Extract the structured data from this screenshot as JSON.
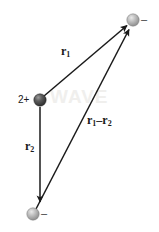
{
  "figure": {
    "background_color": "#ffffff",
    "watermark_text": "WAVE"
  },
  "charges": [
    {
      "id": "positive-charge",
      "label": "2+",
      "sign": "positive",
      "x": 40,
      "y": 100,
      "radius": 6,
      "color": "#4a4a4a"
    },
    {
      "id": "negative-charge-top",
      "label": "–",
      "sign": "negative",
      "x": 133,
      "y": 20,
      "radius": 6,
      "color": "#9a9a9a"
    },
    {
      "id": "negative-charge-bottom",
      "label": "–",
      "sign": "negative",
      "x": 33,
      "y": 214,
      "radius": 6,
      "color": "#9a9a9a"
    }
  ],
  "vectors": [
    {
      "id": "r1",
      "symbol": "r",
      "subscript": "1",
      "from_x": 44,
      "from_y": 96,
      "to_x": 128,
      "to_y": 25,
      "label_x": 61,
      "label_y": 45,
      "color": "#1a1a1a"
    },
    {
      "id": "r2",
      "symbol": "r",
      "subscript": "2",
      "from_x": 40,
      "from_y": 107,
      "to_x": 40,
      "to_y": 203,
      "label_x": 25,
      "label_y": 140,
      "color": "#1a1a1a"
    },
    {
      "id": "r1-minus-r2",
      "symbol": "r",
      "subscript": "1",
      "operator": "–",
      "symbol2": "r",
      "subscript2": "2",
      "from_x": 36,
      "from_y": 209,
      "to_x": 130,
      "to_y": 28,
      "label_x": 87,
      "label_y": 114,
      "color": "#1a1a1a"
    }
  ]
}
